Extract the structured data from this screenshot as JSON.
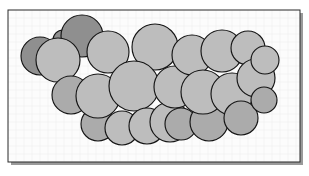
{
  "figure": {
    "kind": "space-filling-molecular-model",
    "caption": "",
    "frame": {
      "border_color": "#2b2b2b",
      "border_width": 1,
      "shadow_color": "#9a9a9a",
      "x": 8,
      "y": 10,
      "width": 292,
      "height": 152
    },
    "canvas": {
      "width": 309,
      "height": 176,
      "background": "#ffffff",
      "plot_background": "#fcfcfc"
    },
    "grid": {
      "visible": true,
      "spacing": 8,
      "color": "#eeeeee",
      "line_width": 0.5
    },
    "palette": {
      "sphere_dark": "#8f8f8f",
      "sphere_light": "#bdbdbd",
      "sphere_mid": "#ababab",
      "outline": "#151515",
      "outline_width": 1.15
    },
    "atoms": [
      {
        "id": "a1",
        "cx": 40,
        "cy": 56,
        "r": 19,
        "shade": "dark",
        "z": 1
      },
      {
        "id": "a2",
        "cx": 63,
        "cy": 40,
        "r": 10,
        "shade": "dark",
        "z": 2
      },
      {
        "id": "a3",
        "cx": 82,
        "cy": 36,
        "r": 21,
        "shade": "dark",
        "z": 4
      },
      {
        "id": "a4",
        "cx": 58,
        "cy": 60,
        "r": 22,
        "shade": "light",
        "z": 5
      },
      {
        "id": "a5",
        "cx": 71,
        "cy": 95,
        "r": 19,
        "shade": "mid",
        "z": 6
      },
      {
        "id": "a6",
        "cx": 98,
        "cy": 96,
        "r": 22,
        "shade": "light",
        "z": 8
      },
      {
        "id": "a7",
        "cx": 108,
        "cy": 52,
        "r": 21,
        "shade": "light",
        "z": 9
      },
      {
        "id": "a8",
        "cx": 98,
        "cy": 124,
        "r": 17,
        "shade": "mid",
        "z": 7
      },
      {
        "id": "a9",
        "cx": 122,
        "cy": 128,
        "r": 17,
        "shade": "light",
        "z": 10
      },
      {
        "id": "a10",
        "cx": 134,
        "cy": 86,
        "r": 25,
        "shade": "light",
        "z": 12
      },
      {
        "id": "a11",
        "cx": 155,
        "cy": 47,
        "r": 23,
        "shade": "light",
        "z": 11
      },
      {
        "id": "a12",
        "cx": 147,
        "cy": 126,
        "r": 18,
        "shade": "light",
        "z": 13
      },
      {
        "id": "a13",
        "cx": 170,
        "cy": 122,
        "r": 20,
        "shade": "light",
        "z": 14
      },
      {
        "id": "a14",
        "cx": 175,
        "cy": 87,
        "r": 21,
        "shade": "light",
        "z": 15
      },
      {
        "id": "a15",
        "cx": 181,
        "cy": 124,
        "r": 16,
        "shade": "mid",
        "z": 16
      },
      {
        "id": "a16",
        "cx": 192,
        "cy": 55,
        "r": 20,
        "shade": "light",
        "z": 17
      },
      {
        "id": "a17",
        "cx": 203,
        "cy": 92,
        "r": 22,
        "shade": "light",
        "z": 19
      },
      {
        "id": "a18",
        "cx": 209,
        "cy": 122,
        "r": 19,
        "shade": "mid",
        "z": 18
      },
      {
        "id": "a19",
        "cx": 222,
        "cy": 51,
        "r": 21,
        "shade": "light",
        "z": 20
      },
      {
        "id": "a20",
        "cx": 232,
        "cy": 94,
        "r": 21,
        "shade": "light",
        "z": 21
      },
      {
        "id": "a21",
        "cx": 241,
        "cy": 118,
        "r": 17,
        "shade": "mid",
        "z": 22
      },
      {
        "id": "a22",
        "cx": 248,
        "cy": 48,
        "r": 17,
        "shade": "light",
        "z": 23
      },
      {
        "id": "a23",
        "cx": 256,
        "cy": 78,
        "r": 19,
        "shade": "light",
        "z": 24
      },
      {
        "id": "a24",
        "cx": 265,
        "cy": 60,
        "r": 14,
        "shade": "light",
        "z": 25
      },
      {
        "id": "a25",
        "cx": 264,
        "cy": 100,
        "r": 13,
        "shade": "mid",
        "z": 26
      }
    ]
  }
}
